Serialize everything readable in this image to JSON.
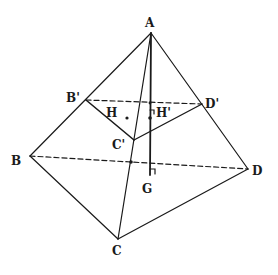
{
  "diagram": {
    "type": "pyramid",
    "stroke_color": "#1a1a1a",
    "background": "#ffffff",
    "vertices": {
      "A": {
        "label": "A",
        "x": 151,
        "y": 33
      },
      "B": {
        "label": "B",
        "x": 30,
        "y": 156
      },
      "C": {
        "label": "C",
        "x": 118,
        "y": 239
      },
      "D": {
        "label": "D",
        "x": 248,
        "y": 169
      },
      "B1": {
        "label": "B'",
        "x": 86,
        "y": 100
      },
      "C1": {
        "label": "C'",
        "x": 134,
        "y": 140
      },
      "D1": {
        "label": "D'",
        "x": 202,
        "y": 104
      }
    },
    "points": {
      "H": {
        "label": "H",
        "x": 127,
        "y": 118
      },
      "H1": {
        "label": "H'",
        "x": 150,
        "y": 118
      },
      "G": {
        "label": "G",
        "x": 150,
        "y": 166
      }
    },
    "labels": [
      {
        "key": "A",
        "text": "A",
        "x": 145,
        "y": 27
      },
      {
        "key": "B",
        "text": "B",
        "x": 11,
        "y": 165
      },
      {
        "key": "C",
        "text": "C",
        "x": 112,
        "y": 255
      },
      {
        "key": "D",
        "text": "D",
        "x": 252,
        "y": 175
      },
      {
        "key": "B1",
        "text": "B'",
        "x": 66,
        "y": 102
      },
      {
        "key": "C1",
        "text": "C'",
        "x": 112,
        "y": 149
      },
      {
        "key": "D1",
        "text": "D'",
        "x": 205,
        "y": 108
      },
      {
        "key": "H",
        "text": "H",
        "x": 106,
        "y": 117
      },
      {
        "key": "H1",
        "text": "H'",
        "x": 156,
        "y": 117
      },
      {
        "key": "G",
        "text": "G",
        "x": 142,
        "y": 193
      }
    ]
  }
}
